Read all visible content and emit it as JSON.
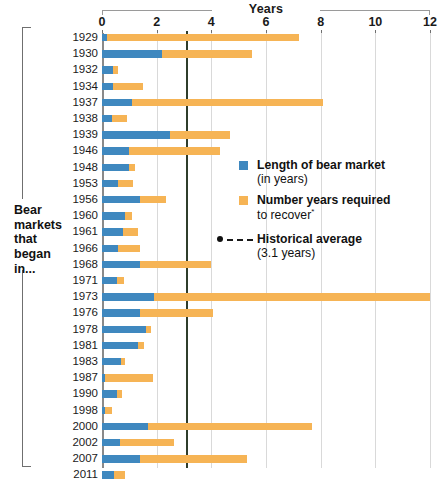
{
  "chart_data": {
    "type": "bar",
    "orientation": "horizontal",
    "stacked": true,
    "title": "Years",
    "xlabel": "Years",
    "ylabel": "Bear markets that began in...",
    "xlim": [
      0,
      12
    ],
    "xticks": [
      0,
      2,
      4,
      6,
      8,
      10,
      12
    ],
    "xtick_labels": [
      "0",
      "2",
      "4",
      "6",
      "8",
      "10",
      "12"
    ],
    "grid": true,
    "legend_position": "center-right",
    "categories": [
      "1929",
      "1930",
      "1932",
      "1934",
      "1937",
      "1938",
      "1939",
      "1946",
      "1948",
      "1953",
      "1956",
      "1960",
      "1961",
      "1966",
      "1968",
      "1971",
      "1973",
      "1976",
      "1978",
      "1981",
      "1983",
      "1987",
      "1990",
      "1998",
      "2000",
      "2002",
      "2007",
      "2011"
    ],
    "series": [
      {
        "name": "Length of bear market (in years)",
        "color": "#3f88bf",
        "values": [
          0.2,
          2.2,
          0.4,
          0.4,
          1.1,
          0.35,
          2.5,
          1.0,
          1.0,
          0.6,
          1.4,
          0.85,
          0.75,
          0.6,
          1.4,
          0.55,
          1.9,
          1.4,
          1.6,
          1.3,
          0.7,
          0.1,
          0.55,
          0.1,
          1.7,
          0.65,
          1.4,
          0.45
        ]
      },
      {
        "name": "Number years required to recover",
        "color": "#f6b455",
        "values": [
          7.0,
          3.3,
          0.2,
          1.1,
          7.0,
          0.55,
          2.2,
          3.3,
          0.2,
          0.55,
          0.95,
          0.25,
          0.55,
          0.8,
          2.6,
          0.25,
          10.1,
          2.65,
          0.2,
          0.25,
          0.15,
          1.75,
          0.2,
          0.25,
          6.0,
          2.0,
          3.9,
          0.4
        ]
      }
    ],
    "totals": [
      7.2,
      5.5,
      0.6,
      1.5,
      8.1,
      0.9,
      4.7,
      4.3,
      1.2,
      1.15,
      2.35,
      1.1,
      1.3,
      1.4,
      4.0,
      0.8,
      12.0,
      4.05,
      1.8,
      1.55,
      0.85,
      1.85,
      0.75,
      0.35,
      7.7,
      2.65,
      5.3,
      0.85
    ],
    "annotations": [
      {
        "label": "Historical average (3.1 years)",
        "value": 3.1,
        "type": "vline",
        "style": "solid-dark"
      }
    ]
  },
  "axis": {
    "title": "Years",
    "tick_labels": [
      "0",
      "2",
      "4",
      "6",
      "8",
      "10",
      "12"
    ]
  },
  "side_label": {
    "line1": "Bear",
    "line2": "markets",
    "line3": "that",
    "line4": "began",
    "line5": "in..."
  },
  "legend": {
    "items": [
      {
        "swatch": "blue",
        "line1": "Length of bear market",
        "line2": "(in years)"
      },
      {
        "swatch": "orange",
        "line1": "Number years required",
        "line2": "to recover",
        "footnote_marker": "*"
      },
      {
        "swatch": "dashed-line",
        "line1": "Historical average",
        "line2": "(3.1 years)"
      }
    ]
  },
  "colors": {
    "bear_market_blue": "#3f88bf",
    "recovery_orange": "#f6b455",
    "average_line": "#2f3d2b",
    "gridline": "#d9d9d9"
  }
}
